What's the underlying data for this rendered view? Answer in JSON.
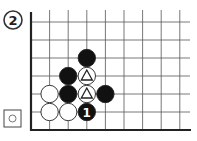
{
  "problem": {
    "number": "2",
    "to_play_icon": "white-stone-square-icon"
  },
  "board": {
    "edges": [
      "left",
      "bottom"
    ],
    "columns": 9,
    "rows": 7,
    "stones": [
      {
        "color": "white",
        "col": 1,
        "row": 4
      },
      {
        "color": "white",
        "col": 1,
        "row": 5
      },
      {
        "color": "white",
        "col": 2,
        "row": 5
      },
      {
        "color": "black",
        "col": 3,
        "row": 2
      },
      {
        "color": "black",
        "col": 2,
        "row": 3
      },
      {
        "color": "black",
        "col": 2,
        "row": 4
      },
      {
        "color": "black",
        "col": 4,
        "row": 4
      },
      {
        "color": "white",
        "col": 3,
        "row": 3,
        "mark": "triangle"
      },
      {
        "color": "white",
        "col": 3,
        "row": 4,
        "mark": "triangle"
      },
      {
        "color": "black",
        "col": 3,
        "row": 5,
        "label": "1"
      }
    ]
  }
}
